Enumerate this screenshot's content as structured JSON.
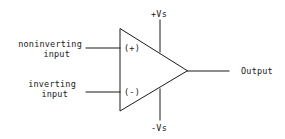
{
  "diagram": {
    "stroke_color": "#1a1a1a",
    "background": "#ffffff",
    "labels": {
      "noninverting_line1": "noninverting",
      "noninverting_line2": "input",
      "inverting_line1": "inverting",
      "inverting_line2": "input",
      "plus_terminal": "(+)",
      "minus_terminal": "(-)",
      "positive_supply": "+Vs",
      "negative_supply": "-Vs",
      "output": "Output"
    }
  }
}
